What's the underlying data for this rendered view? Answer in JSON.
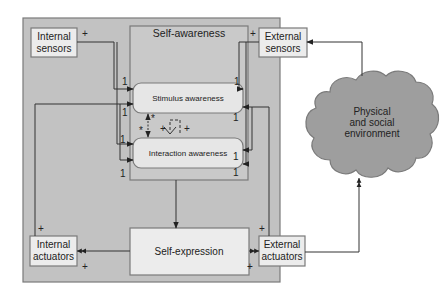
{
  "colors": {
    "outer_fill": "#c2c2c2",
    "inner_fill": "#c9c9c9",
    "box_fill": "#ececec",
    "rounded_fill": "#e6e6e6",
    "cloud_fill": "#9e9e9e",
    "stroke": "#7a7a7a",
    "line": "#333333"
  },
  "nodes": {
    "internal_sensors": {
      "line1": "Internal",
      "line2": "sensors"
    },
    "external_sensors": {
      "line1": "External",
      "line2": "sensors"
    },
    "self_awareness": {
      "title": "Self-awareness"
    },
    "stimulus_awareness": {
      "label": "Stimulus awareness"
    },
    "interaction_awareness": {
      "label": "Interaction awareness"
    },
    "self_expression": {
      "label": "Self-expression"
    },
    "internal_actuators": {
      "line1": "Internal",
      "line2": "actuators"
    },
    "external_actuators": {
      "line1": "External",
      "line2": "actuators"
    },
    "environment": {
      "line1": "Physical",
      "line2": "and social",
      "line3": "environment"
    }
  },
  "multiplicities": {
    "plus": "+",
    "one": "1",
    "star": "*"
  }
}
